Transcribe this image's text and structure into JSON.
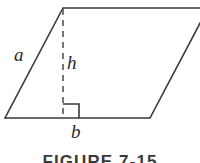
{
  "figure": {
    "type": "parallelogram-area-diagram",
    "caption": "FIGURE 7-15",
    "background_color": "#ffffff",
    "stroke_color": "#3a3a3a",
    "label_color": "#2b2b2b",
    "labels": {
      "side": "a",
      "height": "h",
      "base": "b"
    },
    "geometry": {
      "vertices": {
        "top_left": [
          63,
          8
        ],
        "top_right": [
          208,
          8
        ],
        "bottom_right": [
          150,
          118
        ],
        "bottom_left": [
          5,
          118
        ]
      },
      "height_segment": {
        "from": [
          63,
          8
        ],
        "to": [
          63,
          118
        ],
        "style": "dashed"
      },
      "right_angle_marker": {
        "corner": [
          63,
          118
        ],
        "size": 15
      }
    }
  }
}
